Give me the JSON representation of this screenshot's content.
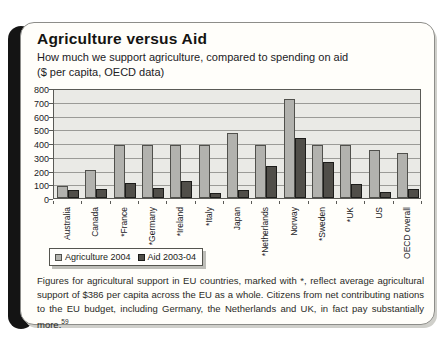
{
  "panel": {
    "title": "Agriculture versus Aid",
    "subtitle_line1": "How much we support agriculture, compared to spending on aid",
    "subtitle_line2": "($ per capita, OECD data)",
    "footnote": "Figures for agricultural support in EU countries, marked with *, reflect average agricultural support of $386 per capita across the EU as a whole. Citizens from net contributing nations to the EU budget, including Germany, the Netherlands and UK, in fact pay substantially more.",
    "footnote_ref": "59"
  },
  "colors": {
    "agriculture_bar": "#b2b2ae",
    "aid_bar": "#504e49",
    "plot_background": "#eaeae6",
    "spine_black": "#141414"
  },
  "chart_data": {
    "type": "bar",
    "categories": [
      "Australia",
      "Canada",
      "*France",
      "*Germany",
      "*Ireland",
      "*Italy",
      "Japan",
      "*Netherlands",
      "Norway",
      "*Sweden",
      "*UK",
      "US",
      "OECD overall"
    ],
    "series": [
      {
        "name": "Agriculture 2004",
        "values": [
          90,
          200,
          386,
          386,
          386,
          386,
          470,
          386,
          720,
          386,
          386,
          350,
          330
        ]
      },
      {
        "name": "Aid 2003-04",
        "values": [
          55,
          65,
          110,
          70,
          120,
          35,
          60,
          230,
          435,
          265,
          100,
          45,
          65
        ]
      }
    ],
    "title": "Agriculture versus Aid",
    "xlabel": "",
    "ylabel": "$ per capita",
    "ylim": [
      0,
      800
    ],
    "ytick_step": 100,
    "grid": true,
    "legend_position": "bottom-left"
  }
}
